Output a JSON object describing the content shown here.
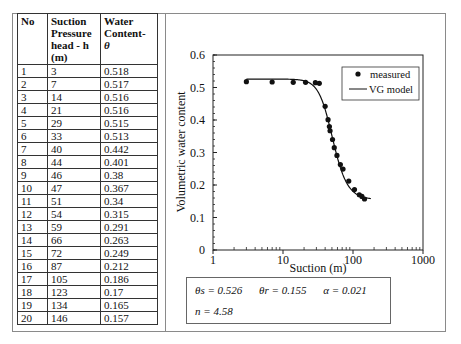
{
  "table": {
    "headers": [
      "No",
      "Suction Pressure head - h (m)",
      "Water Content- θ"
    ],
    "header_lines": {
      "col1": [
        "No"
      ],
      "col2": [
        "Suction",
        "Pressure",
        "head - h",
        "(m)"
      ],
      "col3": [
        "Water",
        "Content-",
        "θ"
      ]
    },
    "rows": [
      [
        "1",
        "3",
        "0.518"
      ],
      [
        "2",
        "7",
        "0.517"
      ],
      [
        "3",
        "14",
        "0.516"
      ],
      [
        "4",
        "21",
        "0.516"
      ],
      [
        "5",
        "29",
        "0.515"
      ],
      [
        "6",
        "33",
        "0.513"
      ],
      [
        "7",
        "40",
        "0.442"
      ],
      [
        "8",
        "44",
        "0.401"
      ],
      [
        "9",
        "46",
        "0.38"
      ],
      [
        "10",
        "47",
        "0.367"
      ],
      [
        "11",
        "51",
        "0.34"
      ],
      [
        "12",
        "54",
        "0.315"
      ],
      [
        "13",
        "59",
        "0.291"
      ],
      [
        "14",
        "66",
        "0.263"
      ],
      [
        "15",
        "72",
        "0.249"
      ],
      [
        "16",
        "87",
        "0.212"
      ],
      [
        "17",
        "105",
        "0.186"
      ],
      [
        "18",
        "123",
        "0.17"
      ],
      [
        "19",
        "134",
        "0.165"
      ],
      [
        "20",
        "146",
        "0.157"
      ]
    ]
  },
  "chart_data": {
    "type": "scatter",
    "title": "",
    "xlabel": "Suction (m)",
    "ylabel": "Volumetric water content",
    "xscale": "log",
    "xlim": [
      1,
      1000
    ],
    "ylim": [
      0,
      0.6
    ],
    "xticks": [
      "1",
      "10",
      "100",
      "1000"
    ],
    "yticks": [
      "0",
      "0.1",
      "0.2",
      "0.3",
      "0.4",
      "0.5",
      "0.6"
    ],
    "grid": false,
    "legend_position": "upper right",
    "series": [
      {
        "name": "measured",
        "style": "markers",
        "x": [
          3,
          7,
          14,
          21,
          29,
          33,
          40,
          44,
          46,
          47,
          51,
          54,
          59,
          66,
          72,
          87,
          105,
          123,
          134,
          146
        ],
        "y": [
          0.518,
          0.517,
          0.516,
          0.516,
          0.515,
          0.513,
          0.442,
          0.401,
          0.38,
          0.367,
          0.34,
          0.315,
          0.291,
          0.263,
          0.249,
          0.212,
          0.186,
          0.17,
          0.165,
          0.157
        ]
      },
      {
        "name": "VG model",
        "style": "line",
        "params": {
          "theta_s": 0.526,
          "theta_r": 0.155,
          "alpha": 0.021,
          "n": 4.58
        }
      }
    ]
  },
  "params_box": {
    "theta_s": "θs = 0.526",
    "theta_r": "θr = 0.155",
    "alpha": "α = 0.021",
    "n": "n = 4.58"
  }
}
